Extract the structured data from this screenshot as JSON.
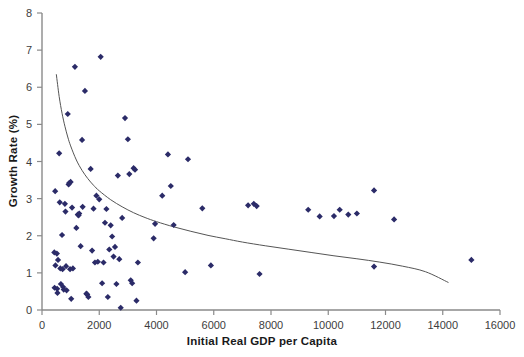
{
  "chart_data": {
    "type": "scatter",
    "title": "",
    "xlabel": "Initial Real GDP per Capita",
    "ylabel": "Growth Rate (%)",
    "xlim": [
      0,
      16000
    ],
    "ylim": [
      0,
      8
    ],
    "xticks": [
      0,
      2000,
      4000,
      6000,
      8000,
      10000,
      12000,
      14000,
      16000
    ],
    "xtick_labels": [
      "0",
      "2000",
      "4000",
      "6000",
      "8000",
      "10000",
      "12000",
      "14000",
      "16000"
    ],
    "yticks": [
      0,
      1,
      2,
      3,
      4,
      5,
      6,
      7,
      8
    ],
    "ytick_labels": [
      "0",
      "1",
      "2",
      "3",
      "4",
      "5",
      "6",
      "7",
      "8"
    ],
    "grid": false,
    "legend": null,
    "marker_color": "#2b2b68",
    "marker_shape": "diamond",
    "marker_size": 4,
    "trendline": {
      "name": "fitted convergence curve",
      "color": "#555555",
      "width": 1,
      "points": [
        [
          500,
          6.35
        ],
        [
          600,
          5.75
        ],
        [
          700,
          5.3
        ],
        [
          800,
          4.95
        ],
        [
          900,
          4.66
        ],
        [
          1000,
          4.42
        ],
        [
          1200,
          4.04
        ],
        [
          1400,
          3.76
        ],
        [
          1600,
          3.54
        ],
        [
          1800,
          3.36
        ],
        [
          2000,
          3.21
        ],
        [
          2400,
          2.97
        ],
        [
          2800,
          2.78
        ],
        [
          3200,
          2.62
        ],
        [
          3600,
          2.49
        ],
        [
          4000,
          2.38
        ],
        [
          4600,
          2.24
        ],
        [
          5200,
          2.12
        ],
        [
          5800,
          2.01
        ],
        [
          6400,
          1.92
        ],
        [
          7000,
          1.83
        ],
        [
          7800,
          1.73
        ],
        [
          8600,
          1.64
        ],
        [
          9400,
          1.55
        ],
        [
          10200,
          1.46
        ],
        [
          11000,
          1.38
        ],
        [
          11800,
          1.29
        ],
        [
          12600,
          1.18
        ],
        [
          13400,
          1.03
        ],
        [
          14200,
          0.74
        ]
      ]
    },
    "series": [
      {
        "name": "countries",
        "points": [
          [
            430,
            1.55
          ],
          [
            440,
            0.6
          ],
          [
            460,
            3.2
          ],
          [
            470,
            1.2
          ],
          [
            520,
            1.52
          ],
          [
            530,
            0.57
          ],
          [
            540,
            0.46
          ],
          [
            560,
            1.35
          ],
          [
            600,
            4.22
          ],
          [
            620,
            2.9
          ],
          [
            640,
            1.12
          ],
          [
            660,
            0.7
          ],
          [
            700,
            2.02
          ],
          [
            720,
            1.1
          ],
          [
            740,
            0.62
          ],
          [
            760,
            0.55
          ],
          [
            800,
            2.86
          ],
          [
            820,
            2.65
          ],
          [
            840,
            1.18
          ],
          [
            860,
            0.53
          ],
          [
            900,
            5.28
          ],
          [
            930,
            3.38
          ],
          [
            950,
            3.42
          ],
          [
            980,
            1.1
          ],
          [
            1000,
            3.45
          ],
          [
            1020,
            0.3
          ],
          [
            1050,
            2.76
          ],
          [
            1080,
            1.12
          ],
          [
            1150,
            6.55
          ],
          [
            1200,
            2.21
          ],
          [
            1250,
            2.57
          ],
          [
            1280,
            2.55
          ],
          [
            1300,
            2.6
          ],
          [
            1350,
            1.72
          ],
          [
            1400,
            4.58
          ],
          [
            1420,
            2.78
          ],
          [
            1500,
            5.9
          ],
          [
            1550,
            0.44
          ],
          [
            1580,
            0.42
          ],
          [
            1620,
            0.35
          ],
          [
            1700,
            3.8
          ],
          [
            1750,
            1.6
          ],
          [
            1800,
            2.73
          ],
          [
            1850,
            1.28
          ],
          [
            1900,
            3.08
          ],
          [
            1950,
            1.3
          ],
          [
            2000,
            2.98
          ],
          [
            2050,
            6.82
          ],
          [
            2100,
            0.72
          ],
          [
            2150,
            1.28
          ],
          [
            2200,
            2.35
          ],
          [
            2250,
            2.72
          ],
          [
            2300,
            0.35
          ],
          [
            2350,
            1.63
          ],
          [
            2400,
            2.28
          ],
          [
            2450,
            1.98
          ],
          [
            2500,
            1.44
          ],
          [
            2550,
            1.7
          ],
          [
            2600,
            0.7
          ],
          [
            2650,
            3.62
          ],
          [
            2700,
            1.37
          ],
          [
            2750,
            0.06
          ],
          [
            2800,
            2.48
          ],
          [
            2900,
            5.17
          ],
          [
            3000,
            4.6
          ],
          [
            3050,
            3.66
          ],
          [
            3100,
            0.8
          ],
          [
            3150,
            0.72
          ],
          [
            3200,
            3.82
          ],
          [
            3250,
            3.78
          ],
          [
            3300,
            0.25
          ],
          [
            3350,
            1.28
          ],
          [
            3900,
            1.93
          ],
          [
            3950,
            2.32
          ],
          [
            4200,
            3.08
          ],
          [
            4400,
            4.19
          ],
          [
            4500,
            3.34
          ],
          [
            4600,
            2.29
          ],
          [
            5000,
            1.02
          ],
          [
            5100,
            4.06
          ],
          [
            5600,
            2.74
          ],
          [
            5900,
            1.2
          ],
          [
            7200,
            2.82
          ],
          [
            7400,
            2.86
          ],
          [
            7500,
            2.8
          ],
          [
            7600,
            0.97
          ],
          [
            9300,
            2.7
          ],
          [
            9700,
            2.52
          ],
          [
            10200,
            2.53
          ],
          [
            10400,
            2.7
          ],
          [
            10700,
            2.57
          ],
          [
            11000,
            2.6
          ],
          [
            11600,
            3.22
          ],
          [
            11600,
            1.17
          ],
          [
            12300,
            2.44
          ],
          [
            15000,
            1.35
          ]
        ]
      }
    ]
  }
}
